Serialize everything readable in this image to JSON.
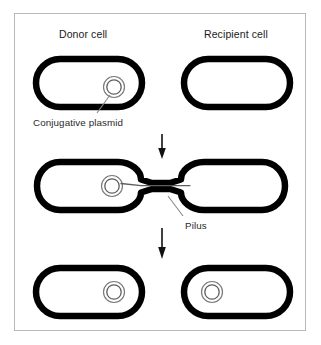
{
  "figure": {
    "frame": {
      "border_color": "#b9b9b9",
      "background": "#ffffff"
    }
  },
  "labels": {
    "donor_cell": "Donor cell",
    "recipient_cell": "Recipient cell",
    "conjugative_plasmid": "Conjugative plasmid",
    "pilus": "Pilus"
  },
  "colors": {
    "cell_outline": "#000000",
    "plasmid_outline": "#6e6e6e",
    "text": "#1a1a1a",
    "callout_text": "#2a2a2a",
    "leader_line": "#8a8a8a",
    "arrow": "#111111",
    "frame": "#b9b9b9",
    "background": "#ffffff"
  },
  "stages": [
    {
      "stage": 1,
      "name": "separate-cells",
      "cells": [
        {
          "role": "donor",
          "has_plasmid": true,
          "plasmid_position": "right"
        },
        {
          "role": "recipient",
          "has_plasmid": false,
          "plasmid_position": null
        }
      ],
      "connected": false
    },
    {
      "stage": 2,
      "name": "pilus-bridge-transfer",
      "cells": [
        {
          "role": "donor",
          "has_plasmid": true,
          "plasmid_position": "right"
        },
        {
          "role": "recipient",
          "has_plasmid": false,
          "plasmid_position": null
        }
      ],
      "connected": true,
      "bridge": "pilus",
      "dna_strand_transferring": true
    },
    {
      "stage": 3,
      "name": "both-cells-contain-plasmid",
      "cells": [
        {
          "role": "donor",
          "has_plasmid": true,
          "plasmid_position": "right"
        },
        {
          "role": "recipient",
          "has_plasmid": true,
          "plasmid_position": "left"
        }
      ],
      "connected": false
    }
  ],
  "arrows": [
    {
      "name": "arrow-stage1-to-stage2",
      "direction": "down"
    },
    {
      "name": "arrow-stage2-to-stage3",
      "direction": "down"
    }
  ]
}
